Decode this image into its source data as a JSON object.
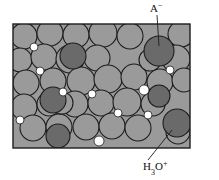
{
  "figure": {
    "type": "molecular-packing-diagram",
    "frame": {
      "x": 13,
      "y": 24,
      "width": 177,
      "height": 124
    },
    "colors": {
      "background": "#ffffff",
      "matrix": "#9a9a9a",
      "sphere_light": "#9a9a9a",
      "sphere_dark": "#6a6a6a",
      "outline": "#1d1d1d",
      "void": "#ffffff",
      "label": "#111111",
      "leader": "#1d1d1d"
    },
    "labels": [
      {
        "name": "anion-label",
        "base": "A",
        "superscript": "−",
        "subscript": "",
        "text": "A⁻",
        "x": 150,
        "y": 12,
        "leader": {
          "x1": 157,
          "y1": 15,
          "x2": 159,
          "y2": 46
        }
      },
      {
        "name": "hydronium-label",
        "base": "H",
        "subscript": "3",
        "base2": "O",
        "superscript": "+",
        "text": "H₃O⁺",
        "x": 143,
        "y": 170,
        "leader": {
          "x1": 148,
          "y1": 160,
          "x2": 172,
          "y2": 130
        }
      }
    ],
    "spheres_light": [
      {
        "cx": 24,
        "cy": 36,
        "r": 13
      },
      {
        "cx": 50,
        "cy": 33,
        "r": 13
      },
      {
        "cx": 76,
        "cy": 35,
        "r": 13
      },
      {
        "cx": 103,
        "cy": 33,
        "r": 14
      },
      {
        "cx": 130,
        "cy": 36,
        "r": 13
      },
      {
        "cx": 181,
        "cy": 34,
        "r": 13
      },
      {
        "cx": 20,
        "cy": 60,
        "r": 12
      },
      {
        "cx": 44,
        "cy": 57,
        "r": 13
      },
      {
        "cx": 70,
        "cy": 59,
        "r": 14
      },
      {
        "cx": 97,
        "cy": 58,
        "r": 13
      },
      {
        "cx": 176,
        "cy": 59,
        "r": 14
      },
      {
        "cx": 26,
        "cy": 83,
        "r": 13
      },
      {
        "cx": 53,
        "cy": 81,
        "r": 13
      },
      {
        "cx": 81,
        "cy": 81,
        "r": 14
      },
      {
        "cx": 108,
        "cy": 79,
        "r": 14
      },
      {
        "cx": 134,
        "cy": 77,
        "r": 13
      },
      {
        "cx": 160,
        "cy": 82,
        "r": 13
      },
      {
        "cx": 184,
        "cy": 80,
        "r": 12
      },
      {
        "cx": 24,
        "cy": 107,
        "r": 13
      },
      {
        "cx": 49,
        "cy": 104,
        "r": 12
      },
      {
        "cx": 75,
        "cy": 104,
        "r": 13
      },
      {
        "cx": 101,
        "cy": 103,
        "r": 13
      },
      {
        "cx": 127,
        "cy": 102,
        "r": 14
      },
      {
        "cx": 153,
        "cy": 104,
        "r": 12
      },
      {
        "cx": 33,
        "cy": 128,
        "r": 13
      },
      {
        "cx": 59,
        "cy": 127,
        "r": 13
      },
      {
        "cx": 86,
        "cy": 127,
        "r": 13
      },
      {
        "cx": 112,
        "cy": 126,
        "r": 13
      },
      {
        "cx": 138,
        "cy": 128,
        "r": 13
      },
      {
        "cx": 178,
        "cy": 132,
        "r": 12
      },
      {
        "cx": 62,
        "cy": 103,
        "r": 11
      },
      {
        "cx": 150,
        "cy": 60,
        "r": 11
      }
    ],
    "spheres_dark": [
      {
        "cx": 73,
        "cy": 56,
        "r": 13,
        "name": "dark-sphere-upper-left"
      },
      {
        "cx": 159,
        "cy": 51,
        "r": 15,
        "name": "anion-sphere"
      },
      {
        "cx": 53,
        "cy": 100,
        "r": 13,
        "name": "dark-sphere-mid-left"
      },
      {
        "cx": 58,
        "cy": 136,
        "r": 12,
        "name": "dark-sphere-lower-left"
      },
      {
        "cx": 159,
        "cy": 96,
        "r": 11,
        "name": "dark-sphere-right"
      },
      {
        "cx": 177,
        "cy": 123,
        "r": 14,
        "name": "hydronium-sphere"
      }
    ],
    "voids": [
      {
        "cx": 34,
        "cy": 47,
        "r": 4
      },
      {
        "cx": 40,
        "cy": 71,
        "r": 4
      },
      {
        "cx": 63,
        "cy": 92,
        "r": 4
      },
      {
        "cx": 92,
        "cy": 94,
        "r": 4
      },
      {
        "cx": 144,
        "cy": 90,
        "r": 5
      },
      {
        "cx": 170,
        "cy": 70,
        "r": 4
      },
      {
        "cx": 118,
        "cy": 113,
        "r": 4
      },
      {
        "cx": 20,
        "cy": 120,
        "r": 4
      },
      {
        "cx": 99,
        "cy": 141,
        "r": 5
      },
      {
        "cx": 148,
        "cy": 115,
        "r": 4
      }
    ]
  }
}
